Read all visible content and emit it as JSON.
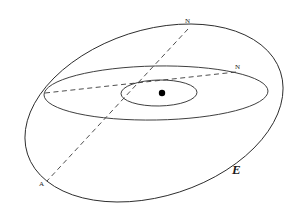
{
  "figure": {
    "background_color": "#ffffff",
    "stroke_color": "#2b2b2b",
    "dash_color": "#3a3a3a",
    "point_color": "#000000",
    "width": 298,
    "height": 211
  },
  "labels": {
    "north_pole": "N",
    "node": "N",
    "apex": "A",
    "plane": "E"
  },
  "chart_data": {
    "type": "diagram",
    "ellipses": [
      {
        "name": "outer-ellipse",
        "role": "outer orbital plane E",
        "center_x": 154,
        "center_y": 113,
        "radius_x": 133,
        "radius_y": 83,
        "rotation_deg": -18,
        "style": "solid"
      },
      {
        "name": "middle-ellipse",
        "role": "intermediate ellipse",
        "center_x": 156,
        "center_y": 93,
        "radius_x": 112,
        "radius_y": 27,
        "rotation_deg": -1,
        "style": "solid"
      },
      {
        "name": "inner-ellipse",
        "role": "inner small ellipse",
        "center_x": 159,
        "center_y": 93,
        "radius_x": 38,
        "radius_y": 13,
        "rotation_deg": -1,
        "style": "solid"
      }
    ],
    "points": [
      {
        "name": "center-point",
        "label": "",
        "x": 162,
        "y": 93,
        "marker": "filled-dot",
        "radius": 3.2
      },
      {
        "name": "north-pole-point",
        "label": "N",
        "x": 188,
        "y": 29
      },
      {
        "name": "node-point",
        "label": "N",
        "x": 236,
        "y": 72
      },
      {
        "name": "apex-point",
        "label": "A",
        "x": 47,
        "y": 181
      }
    ],
    "dashed_lines": [
      {
        "name": "polar-axis",
        "from": {
          "x": 188,
          "y": 29,
          "label": "N"
        },
        "to": {
          "x": 47,
          "y": 181,
          "label": "A"
        },
        "through": {
          "x": 162,
          "y": 93
        }
      },
      {
        "name": "node-line",
        "from": {
          "x": 45,
          "y": 93
        },
        "to": {
          "x": 236,
          "y": 72,
          "label": "N"
        },
        "through": {
          "x": 162,
          "y": 93
        }
      }
    ],
    "annotations": [
      {
        "name": "plane-label",
        "text": "E",
        "x": 238,
        "y": 172
      }
    ],
    "xlabel": "",
    "ylabel": "",
    "grid": false,
    "legend": "none"
  }
}
